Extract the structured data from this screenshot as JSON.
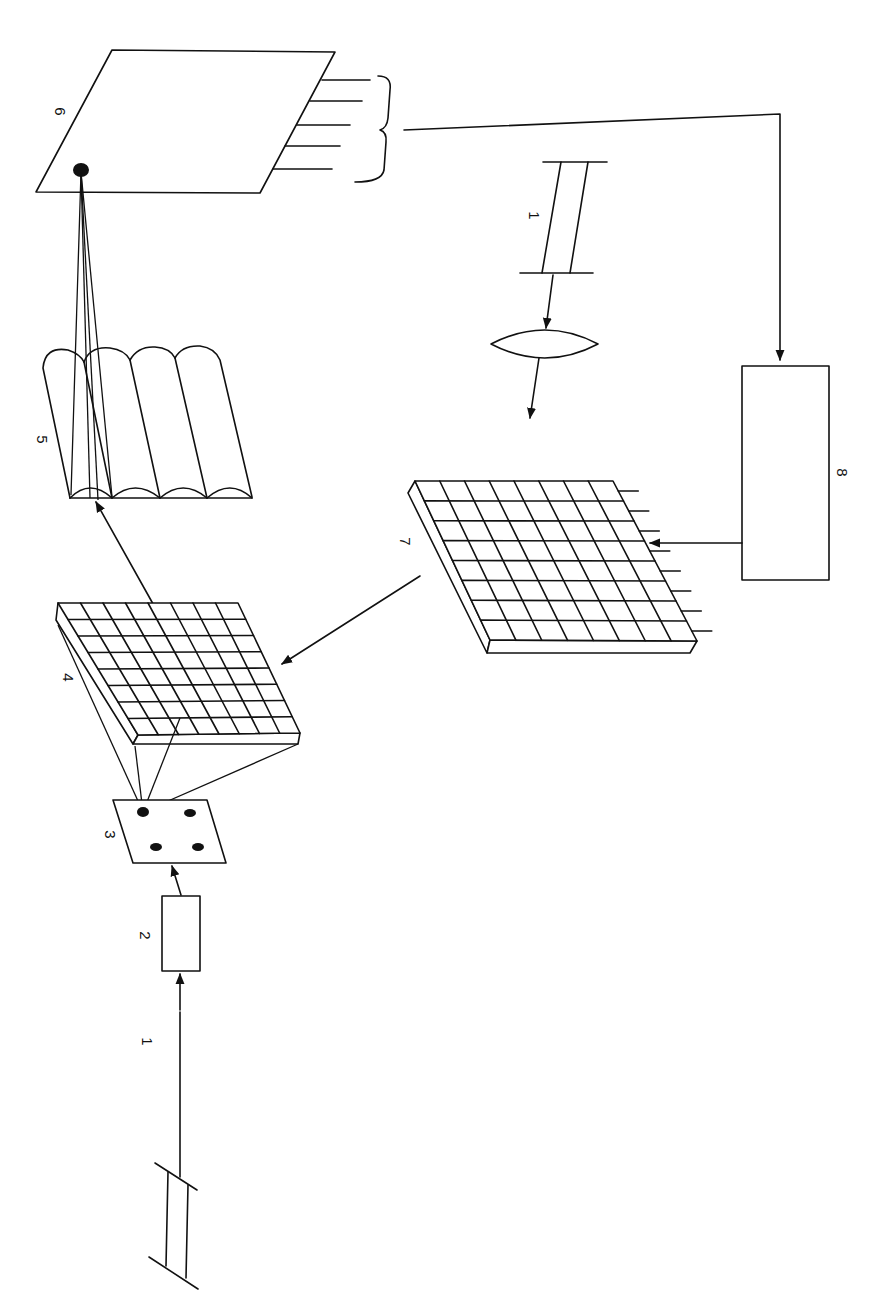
{
  "figure": {
    "orientation": "rotated 90 degrees clockwise",
    "colors": {
      "ink": "#111111",
      "background": "#ffffff"
    }
  },
  "components": [
    {
      "id": "1a",
      "label": "1",
      "shape": "light-source-parallel-plates",
      "position": "bottom-left"
    },
    {
      "id": "2",
      "label": "2",
      "shape": "rectangular-box"
    },
    {
      "id": "3",
      "label": "3",
      "shape": "plate-with-four-dots"
    },
    {
      "id": "4",
      "label": "4",
      "shape": "8x8-grid-array"
    },
    {
      "id": "5",
      "label": "5",
      "shape": "cylindrical-lens-array"
    },
    {
      "id": "6",
      "label": "6",
      "shape": "detector-plate-with-output-pins"
    },
    {
      "id": "1b",
      "label": "1",
      "shape": "light-source-parallel-plates",
      "position": "top-center"
    },
    {
      "id": "lens",
      "label": "",
      "shape": "biconvex-lens"
    },
    {
      "id": "7",
      "label": "7",
      "shape": "8x8-grid-array-with-pins"
    },
    {
      "id": "8",
      "label": "8",
      "shape": "rectangular-box"
    }
  ],
  "labels": {
    "l1_bottom": "1",
    "l2": "2",
    "l3": "3",
    "l4": "4",
    "l5": "5",
    "l6": "6",
    "l1_top": "1",
    "l7": "7",
    "l8": "8"
  },
  "connections": [
    {
      "from": "1a",
      "to": "2"
    },
    {
      "from": "2",
      "to": "3"
    },
    {
      "from": "3",
      "to": "4",
      "type": "ray-fan"
    },
    {
      "from": "4",
      "to": "5"
    },
    {
      "from": "5",
      "to": "6",
      "type": "ray-fan"
    },
    {
      "from": "6",
      "to": "8",
      "via": "output-pins-brace"
    },
    {
      "from": "1b",
      "to": "lens"
    },
    {
      "from": "lens",
      "to": "7"
    },
    {
      "from": "8",
      "to": "7"
    },
    {
      "from": "7",
      "to": "4"
    }
  ]
}
